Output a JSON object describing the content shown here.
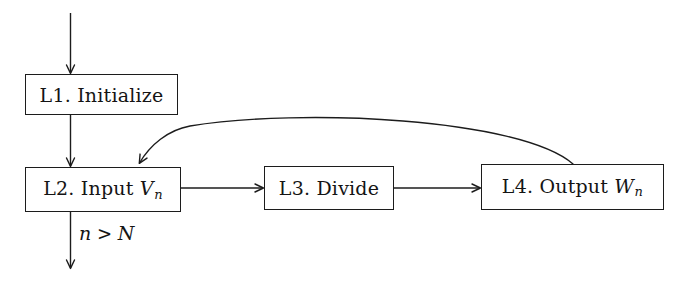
{
  "diagram": {
    "type": "flowchart",
    "background_color": "#ffffff",
    "stroke_color": "#1c1c1c",
    "text_color": "#141414",
    "nodes": [
      {
        "id": "L1",
        "label": "L1. Initialize",
        "label_prefix": "L1. Initialize",
        "label_var": "",
        "label_sub": "",
        "x": 25,
        "y": 74,
        "w": 153,
        "h": 41
      },
      {
        "id": "L2",
        "label": "L2. Input Vn",
        "label_prefix": "L2. Input ",
        "label_var": "V",
        "label_sub": "n",
        "x": 25,
        "y": 167,
        "w": 156,
        "h": 45
      },
      {
        "id": "L3",
        "label": "L3. Divide",
        "label_prefix": "L3. Divide",
        "label_var": "",
        "label_sub": "",
        "x": 264,
        "y": 166,
        "w": 130,
        "h": 44
      },
      {
        "id": "L4",
        "label": "L4. Output Wn",
        "label_prefix": "L4. Output ",
        "label_var": "W",
        "label_sub": "n",
        "x": 481,
        "y": 164,
        "w": 183,
        "h": 46
      }
    ],
    "edges": [
      {
        "id": "entry",
        "from": "",
        "to": "L1",
        "kind": "straight",
        "label": ""
      },
      {
        "id": "l1-l2",
        "from": "L1",
        "to": "L2",
        "kind": "straight",
        "label": ""
      },
      {
        "id": "l2-l3",
        "from": "L2",
        "to": "L3",
        "kind": "straight",
        "label": ""
      },
      {
        "id": "l3-l4",
        "from": "L3",
        "to": "L4",
        "kind": "straight",
        "label": ""
      },
      {
        "id": "l4-l2-feedback",
        "from": "L4",
        "to": "L2",
        "kind": "curved",
        "label": ""
      },
      {
        "id": "exit",
        "from": "L2",
        "to": "",
        "kind": "straight",
        "label": "n > N"
      }
    ],
    "edge_labels": {
      "exit_condition_n": "n",
      "exit_condition_op": " > ",
      "exit_condition_N": "N"
    }
  }
}
